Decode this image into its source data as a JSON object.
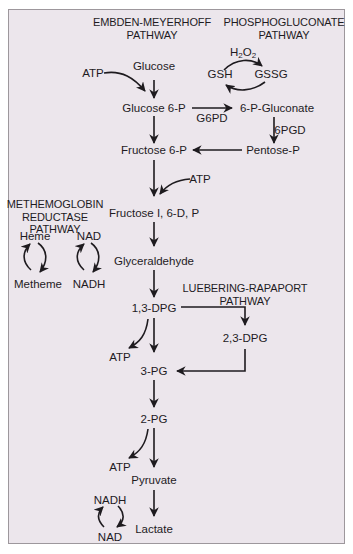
{
  "headers": {
    "embden": [
      "EMBDEN-MEYERHOFF",
      "PATHWAY"
    ],
    "phospho": [
      "PHOSPHOGLUCONATE",
      "PATHWAY"
    ],
    "methemo": [
      "METHEMOGLOBIN",
      "REDUCTASE",
      "PATHWAY"
    ],
    "luebering": [
      "LUEBERING-RAPAPORT",
      "PATHWAY"
    ]
  },
  "nodes": {
    "glucose": "Glucose",
    "atp1": "ATP",
    "glucose6p": "Glucose 6-P",
    "g6pd": "G6PD",
    "gluconate": "6-P-Gluconate",
    "h2o2_main": "H",
    "h2o2_sub1": "2",
    "h2o2_o": "O",
    "h2o2_sub2": "2",
    "gsh": "GSH",
    "gssg": "GSSG",
    "pgd": "6PGD",
    "fructose6p": "Fructose 6-P",
    "pentosep": "Pentose-P",
    "atp2": "ATP",
    "fructose16dp": "Fructose I, 6-D, P",
    "glyceraldehyde": "Glyceraldehyde",
    "heme": "Heme",
    "metheme": "Metheme",
    "nad1": "NAD",
    "nadh1": "NADH",
    "dpg13": "1,3-DPG",
    "dpg23": "2,3-DPG",
    "atp3": "ATP",
    "pg3": "3-PG",
    "pg2": "2-PG",
    "atp4": "ATP",
    "pyruvate": "Pyruvate",
    "lactate": "Lactate",
    "nadh2": "NADH",
    "nad2": "NAD"
  },
  "colors": {
    "background": "#ece6ec",
    "border": "#9d979c",
    "ink": "#1e1b1f"
  }
}
